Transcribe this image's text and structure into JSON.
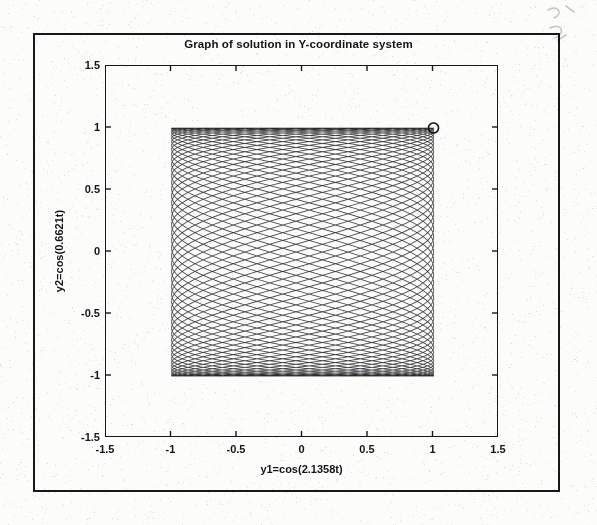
{
  "figure": {
    "title": "Graph of solution in Y-coordinate system",
    "frame_color": "#16181a",
    "background_color": "#fcfcfb"
  },
  "axes": {
    "xlabel": "y1=cos(2.1358t)",
    "ylabel": "y2=cos(0.6621t)",
    "xticks": [
      "-1.5",
      "-1",
      "-0.5",
      "0",
      "0.5",
      "1",
      "1.5"
    ],
    "yticks": [
      "1.5",
      "1",
      "0.5",
      "0",
      "-0.5",
      "-1",
      "-1.5"
    ]
  },
  "chart_data": {
    "type": "line",
    "title": "Graph of solution in Y-coordinate system",
    "xlabel": "y1=cos(2.1358t)",
    "ylabel": "y2=cos(0.6621t)",
    "xlim": [
      -1.5,
      1.5
    ],
    "ylim": [
      -1.5,
      1.5
    ],
    "xticks": [
      -1.5,
      -1,
      -0.5,
      0,
      0.5,
      1,
      1.5
    ],
    "yticks": [
      -1.5,
      -1,
      -0.5,
      0,
      0.5,
      1,
      1.5
    ],
    "grid": false,
    "legend": null,
    "curve": {
      "description": "Lissajous figure traced by parametric solution y1=cos(2.1358t), y2=cos(0.6621t)",
      "parametric": true,
      "x_expression": "cos(2.1358*t)",
      "y_expression": "cos(0.6621*t)",
      "omega_x": 2.1358,
      "omega_y": 0.6621,
      "frequency_ratio": 3.2258,
      "t_start": 0,
      "t_end": 190,
      "samples": 46000,
      "line_color": "#111315",
      "line_width": 0.55,
      "x_range": [
        -1,
        1
      ],
      "y_range": [
        -1,
        1
      ]
    },
    "markers": [
      {
        "name": "start-point",
        "x": 1.0,
        "y": 1.0,
        "shape": "circle",
        "filled": false,
        "radius_px": 5
      }
    ]
  }
}
